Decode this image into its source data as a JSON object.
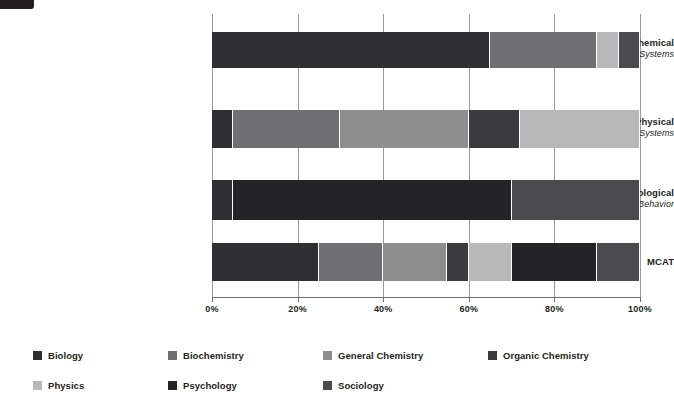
{
  "chart_data": {
    "type": "bar",
    "orientation": "horizontal",
    "stacked": true,
    "stack_mode": "percent",
    "title": "",
    "subtitle": "",
    "xlabel": "",
    "ylabel": "",
    "xlim": [
      0,
      100
    ],
    "grid": true,
    "legend_position": "bottom",
    "xticks": [
      "0%",
      "20%",
      "40%",
      "60%",
      "80%",
      "100%"
    ],
    "xtick_values": [
      0,
      20,
      40,
      60,
      80,
      100
    ],
    "categories": [
      {
        "main": "Biological and Biochemical",
        "sub": "Foundations of Living Systems"
      },
      {
        "main": "Chemical and Physical",
        "sub": "Foundations of Biological Systems"
      },
      {
        "main": "Psychological, Social, and Biological",
        "sub": "Foundations of Behavior"
      },
      {
        "main": "MCAT",
        "sub": ""
      }
    ],
    "series": [
      {
        "name": "Biology",
        "color": "#2f3033",
        "values": [
          65,
          5,
          5,
          25
        ]
      },
      {
        "name": "Biochemistry",
        "color": "#6f7073",
        "values": [
          25,
          25,
          0,
          15
        ]
      },
      {
        "name": "General Chemistry",
        "color": "#8d8e90",
        "values": [
          0,
          30,
          0,
          15
        ]
      },
      {
        "name": "Organic Chemistry",
        "color": "#3a3b3e",
        "values": [
          0,
          12,
          0,
          5
        ]
      },
      {
        "name": "Physics",
        "color": "#b7b8ba",
        "values": [
          5,
          28,
          0,
          10
        ]
      },
      {
        "name": "Psychology",
        "color": "#232427",
        "values": [
          0,
          0,
          65,
          20
        ]
      },
      {
        "name": "Sociology",
        "color": "#4a4b4e",
        "values": [
          5,
          0,
          30,
          10
        ]
      }
    ]
  },
  "legend": {
    "items": [
      {
        "label": "Biology",
        "color": "#2f3033"
      },
      {
        "label": "Biochemistry",
        "color": "#6f7073"
      },
      {
        "label": "General Chemistry",
        "color": "#8d8e90"
      },
      {
        "label": "Organic Chemistry",
        "color": "#3a3b3e"
      },
      {
        "label": "Physics",
        "color": "#b7b8ba"
      },
      {
        "label": "Psychology",
        "color": "#232427"
      },
      {
        "label": "Sociology",
        "color": "#4a4b4e"
      }
    ]
  },
  "colors": {
    "background": "#ffffff",
    "text": "#231f20",
    "gridline": "#9a9a9a",
    "axis": "#6e6e6e",
    "corner_tab": "#231f20"
  }
}
